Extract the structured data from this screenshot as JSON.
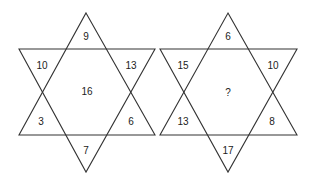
{
  "puzzle": {
    "stars": [
      {
        "top": "9",
        "upper_left": "10",
        "upper_right": "13",
        "center": "16",
        "lower_left": "3",
        "lower_right": "6",
        "bottom": "7"
      },
      {
        "top": "6",
        "upper_left": "15",
        "upper_right": "10",
        "center": "?",
        "lower_left": "13",
        "lower_right": "8",
        "bottom": "17"
      }
    ]
  }
}
